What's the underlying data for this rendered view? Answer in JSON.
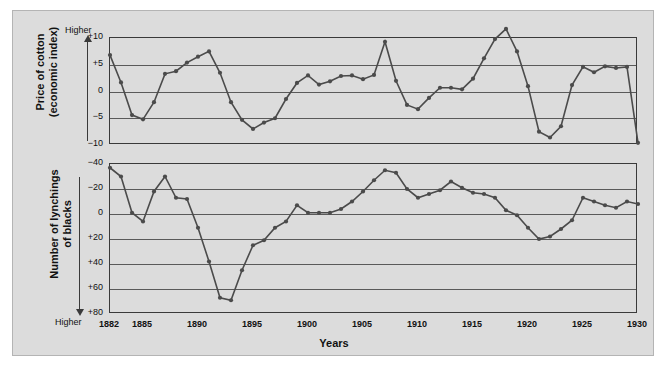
{
  "figure": {
    "background_color": "#dcdcdc",
    "series_color": "#4b4b4b",
    "gridline_color": "#5a5a5a",
    "xaxis_title": "Years"
  },
  "top_panel": {
    "ylabel_line1": "Price of cotton",
    "ylabel_line2": "(economic index)",
    "direction_tag": "Higher",
    "yticks": [
      "+10",
      "+5",
      "0",
      "−5",
      "−10"
    ]
  },
  "bottom_panel": {
    "ylabel_line1": "Number of lynchings",
    "ylabel_line2": "of blacks",
    "direction_tag": "Higher",
    "yticks": [
      "−40",
      "−20",
      "0",
      "+20",
      "+40",
      "+60",
      "+80"
    ]
  },
  "xticks": [
    "1882",
    "1885",
    "1890",
    "1895",
    "1900",
    "1905",
    "1910",
    "1915",
    "1920",
    "1925",
    "1930"
  ],
  "chart_data": {
    "type": "line",
    "title": "",
    "xlabel": "Years",
    "panels": [
      {
        "name": "price-of-cotton",
        "ylabel": "Price of cotton (economic index)",
        "ylim": [
          -10,
          10
        ],
        "yticks": [
          10,
          5,
          0,
          -5,
          -10
        ],
        "direction_note": "Higher values upward",
        "grid": true,
        "x": [
          1882,
          1883,
          1884,
          1885,
          1886,
          1887,
          1888,
          1889,
          1890,
          1891,
          1892,
          1893,
          1894,
          1895,
          1896,
          1897,
          1898,
          1899,
          1900,
          1901,
          1902,
          1903,
          1904,
          1905,
          1906,
          1907,
          1908,
          1909,
          1910,
          1911,
          1912,
          1913,
          1914,
          1915,
          1916,
          1917,
          1918,
          1919,
          1920,
          1921,
          1922,
          1923,
          1924,
          1925,
          1926,
          1927,
          1928,
          1929,
          1930
        ],
        "values": [
          6.8,
          1.7,
          -4.4,
          -5.2,
          -2.0,
          3.3,
          3.8,
          5.4,
          6.5,
          7.5,
          3.5,
          -2.0,
          -5.3,
          -7.0,
          -5.8,
          -5.0,
          -1.4,
          1.6,
          3.0,
          1.3,
          1.9,
          2.9,
          3.0,
          2.3,
          3.1,
          9.3,
          2.0,
          -2.5,
          -3.3,
          -1.2,
          0.7,
          0.7,
          0.4,
          2.4,
          6.2,
          9.8,
          11.7,
          7.5,
          1.0,
          -7.5,
          -8.6,
          -6.5,
          1.2,
          4.6,
          3.6,
          4.7,
          4.4,
          4.6,
          -9.6
        ]
      },
      {
        "name": "lynchings-of-blacks",
        "ylabel": "Number of lynchings of blacks",
        "ylim": [
          80,
          -40
        ],
        "yticks": [
          -40,
          -20,
          0,
          20,
          40,
          60,
          80
        ],
        "axis_inverted": true,
        "direction_note": "Higher values downward",
        "grid": true,
        "x": [
          1882,
          1883,
          1884,
          1885,
          1886,
          1887,
          1888,
          1889,
          1890,
          1891,
          1892,
          1893,
          1894,
          1895,
          1896,
          1897,
          1898,
          1899,
          1900,
          1901,
          1902,
          1903,
          1904,
          1905,
          1906,
          1907,
          1908,
          1909,
          1910,
          1911,
          1912,
          1913,
          1914,
          1915,
          1916,
          1917,
          1918,
          1919,
          1920,
          1921,
          1922,
          1923,
          1924,
          1925,
          1926,
          1927,
          1928,
          1929,
          1930
        ],
        "values": [
          -37,
          -30,
          -1,
          6,
          -18,
          -30,
          -13,
          -12,
          11,
          38,
          67,
          69,
          45,
          25,
          21,
          11,
          6,
          -7,
          -1,
          -1,
          -1,
          -4,
          -10,
          -18,
          -27,
          -35,
          -33,
          -20,
          -13,
          -16,
          -19,
          -26,
          -21,
          -17,
          -16,
          -13,
          -3,
          1,
          11,
          20,
          18,
          12,
          5,
          -13,
          -10,
          -7,
          -5,
          -10,
          -8,
          0,
          3
        ]
      }
    ]
  }
}
